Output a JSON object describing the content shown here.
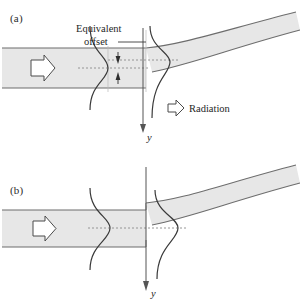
{
  "figure": {
    "type": "optical-waveguide-diagram",
    "background_color": "#ffffff",
    "guide_fill": "#e7e7e7",
    "guide_stroke": "#6d6d6d",
    "curve_stroke": "#3a3a3a",
    "axis_stroke": "#555555",
    "dash_stroke": "#8a8a8a",
    "text_color": "#262626"
  },
  "panel_a": {
    "label": "(a)",
    "annotations": {
      "equivalent_line1": "Equivalent",
      "equivalent_line2": "offset",
      "radiation": "Radiation",
      "axis_label": "y"
    },
    "icons": {
      "input_arrow": "arrow-right-hollow-icon",
      "radiation_arrow": "arrow-right-hollow-icon",
      "offset_arrow_upper": "arrow-down-small-icon",
      "offset_arrow_lower": "arrow-up-small-icon",
      "axis_arrow": "arrow-down-icon"
    },
    "has_offset": true
  },
  "panel_b": {
    "label": "(b)",
    "annotations": {
      "axis_label": "y"
    },
    "icons": {
      "input_arrow": "arrow-right-hollow-icon",
      "axis_arrow": "arrow-down-icon"
    },
    "has_offset": false
  }
}
